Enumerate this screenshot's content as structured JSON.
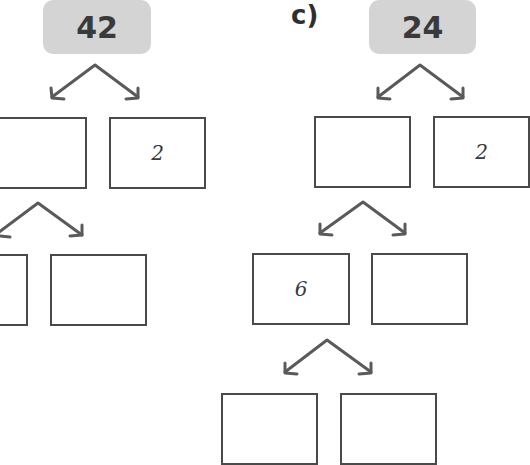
{
  "problems": [
    {
      "label": "",
      "root": "42",
      "level1": [
        "",
        "2"
      ],
      "level2": [
        "",
        ""
      ]
    },
    {
      "label": "c)",
      "root": "24",
      "level1": [
        "",
        "2"
      ],
      "level2": [
        "6",
        ""
      ],
      "level3": [
        "",
        ""
      ]
    }
  ],
  "colors": {
    "root_fill": "#d4d4d4",
    "stroke": "#4a4a4a"
  }
}
